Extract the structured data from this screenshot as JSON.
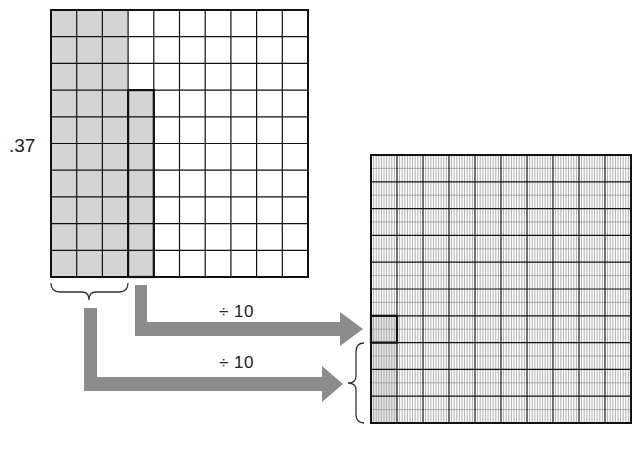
{
  "diagram": {
    "decimal_label": ".37",
    "arrows": [
      {
        "label": "÷ 10",
        "from": "tenths-column-4 (7 hundredths)",
        "to": "thousandths cell"
      },
      {
        "label": "÷ 10",
        "from": "three tenths columns",
        "to": "three hundredths cells"
      }
    ],
    "left_grid": {
      "rows": 10,
      "cols": 10,
      "shaded_full_columns": 3,
      "shaded_partial_column_cells": 7,
      "represents": "hundredths grid showing .37"
    },
    "right_grid": {
      "rows": 10,
      "cols": 10,
      "sub_cols_per_cell": 10,
      "sub_rows_per_cell": 2,
      "highlighted_cell_row": 7,
      "shaded_rows_first_column": [
        7,
        8,
        9,
        10
      ],
      "represents": "thousandths grid showing .037"
    },
    "colors": {
      "shade_left": "#d4d4d4",
      "shade_right": "#e6e6e6",
      "arrow": "#8c8c8c",
      "grid_major": "#111111",
      "grid_minor": "#9a9a9a"
    }
  }
}
